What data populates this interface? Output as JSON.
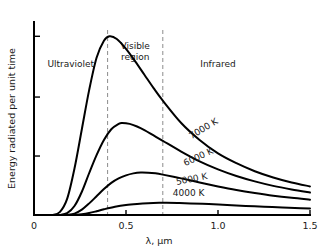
{
  "chart_data": {
    "type": "line",
    "title": "",
    "xlabel": "λ, μm",
    "ylabel": "Energy radiated per unit time",
    "xlim": [
      0,
      1.5
    ],
    "ylim": [
      0,
      1.08
    ],
    "grid": false,
    "legend": "inline-curve-labels",
    "xticks": [
      {
        "value": 0,
        "label": "0"
      },
      {
        "value": 0.5,
        "label": "0.5"
      },
      {
        "value": 1.0,
        "label": "1.0"
      },
      {
        "value": 1.5,
        "label": "1.5"
      }
    ],
    "yticks": [
      {
        "value": 0.33,
        "label": ""
      },
      {
        "value": 0.66,
        "label": ""
      },
      {
        "value": 1.0,
        "label": ""
      }
    ],
    "annotations": [
      {
        "name": "ultraviolet",
        "text": "Ultraviolet",
        "x": 0.2,
        "y": 0.86
      },
      {
        "name": "visible-region",
        "text": "Visible",
        "text2": "region",
        "x": 0.55,
        "y": 0.93
      },
      {
        "name": "infrared",
        "text": "Infrared",
        "x": 1.0,
        "y": 0.86
      }
    ],
    "dividers": [
      {
        "name": "uv-visible-boundary",
        "x": 0.4
      },
      {
        "name": "visible-ir-boundary",
        "x": 0.7
      }
    ],
    "series": [
      {
        "name": "7000 K",
        "label": "7000 K",
        "label_x": 0.93,
        "label_y": 0.47,
        "label_rotation": -31,
        "peak_wavelength_um": 0.41,
        "peak_value": 1.0,
        "x": [
          0.1,
          0.14,
          0.18,
          0.22,
          0.26,
          0.3,
          0.34,
          0.38,
          0.41,
          0.45,
          0.5,
          0.55,
          0.6,
          0.65,
          0.7,
          0.8,
          0.9,
          1.0,
          1.1,
          1.2,
          1.3,
          1.4,
          1.5
        ],
        "y": [
          0.0,
          0.016,
          0.09,
          0.26,
          0.48,
          0.7,
          0.88,
          0.975,
          1.0,
          0.985,
          0.93,
          0.86,
          0.785,
          0.71,
          0.64,
          0.515,
          0.42,
          0.345,
          0.29,
          0.245,
          0.21,
          0.182,
          0.16
        ]
      },
      {
        "name": "6000 K",
        "label": "6000 K",
        "label_x": 0.9,
        "label_y": 0.31,
        "label_rotation": -25,
        "peak_wavelength_um": 0.48,
        "peak_value": 0.515,
        "x": [
          0.14,
          0.18,
          0.22,
          0.26,
          0.3,
          0.34,
          0.38,
          0.42,
          0.46,
          0.48,
          0.52,
          0.56,
          0.6,
          0.65,
          0.7,
          0.8,
          0.9,
          1.0,
          1.1,
          1.2,
          1.3,
          1.4,
          1.5
        ],
        "y": [
          0.0,
          0.01,
          0.05,
          0.13,
          0.235,
          0.335,
          0.42,
          0.48,
          0.51,
          0.515,
          0.51,
          0.495,
          0.475,
          0.445,
          0.415,
          0.355,
          0.3,
          0.255,
          0.218,
          0.188,
          0.163,
          0.143,
          0.126
        ]
      },
      {
        "name": "5000 K",
        "label": "5000 K",
        "label_x": 0.86,
        "label_y": 0.185,
        "label_rotation": -11,
        "peak_wavelength_um": 0.58,
        "peak_value": 0.238,
        "x": [
          0.18,
          0.22,
          0.26,
          0.3,
          0.34,
          0.38,
          0.42,
          0.46,
          0.5,
          0.54,
          0.58,
          0.62,
          0.66,
          0.7,
          0.8,
          0.9,
          1.0,
          1.1,
          1.2,
          1.3,
          1.4,
          1.5
        ],
        "y": [
          0.0,
          0.008,
          0.03,
          0.065,
          0.105,
          0.145,
          0.18,
          0.205,
          0.222,
          0.233,
          0.238,
          0.237,
          0.233,
          0.226,
          0.205,
          0.182,
          0.16,
          0.14,
          0.123,
          0.108,
          0.096,
          0.086
        ]
      },
      {
        "name": "4000 K",
        "label": "4000 K",
        "label_x": 0.84,
        "label_y": 0.105,
        "label_rotation": 0,
        "peak_wavelength_um": 0.72,
        "peak_value": 0.068,
        "x": [
          0.22,
          0.26,
          0.3,
          0.34,
          0.38,
          0.44,
          0.5,
          0.56,
          0.62,
          0.68,
          0.72,
          0.78,
          0.85,
          0.95,
          1.05,
          1.15,
          1.25,
          1.35,
          1.45,
          1.5
        ],
        "y": [
          0.0,
          0.004,
          0.011,
          0.021,
          0.032,
          0.046,
          0.056,
          0.062,
          0.066,
          0.068,
          0.068,
          0.067,
          0.065,
          0.061,
          0.056,
          0.051,
          0.046,
          0.042,
          0.038,
          0.036
        ]
      }
    ]
  },
  "colors": {
    "background": "#ffffff",
    "axis": "#000000",
    "curve": "#000000",
    "divider": "#8c8c8c",
    "text": "#1a1a1a"
  }
}
